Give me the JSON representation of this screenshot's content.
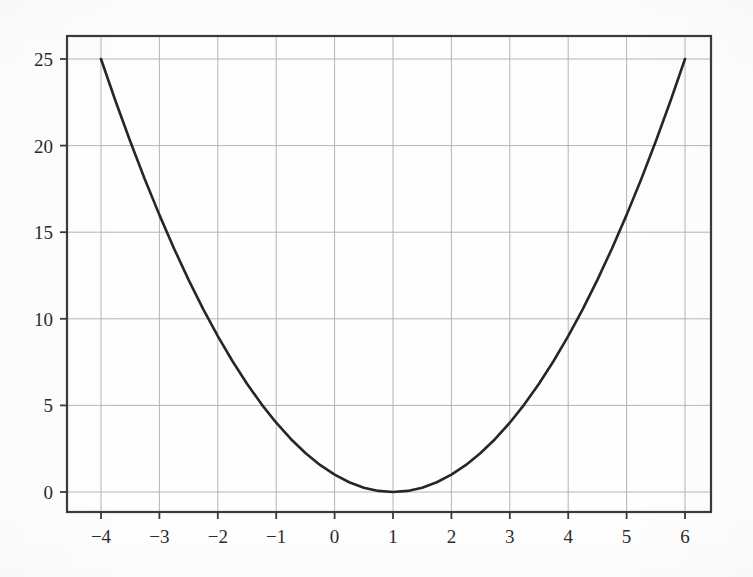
{
  "figure": {
    "background_color": "#fefefe",
    "frame_color": "#3a3a3a",
    "grid_color": "#b4b4b4",
    "curve_color": "#262626",
    "tick_label_color": "#2b2b2b"
  },
  "chart_data": {
    "type": "line",
    "title": "",
    "subtitle": "",
    "xlabel": "",
    "ylabel": "",
    "equation": "y = (x - 1)^2",
    "xlim": [
      -4.6,
      6.45
    ],
    "ylim": [
      -1.4,
      26.3
    ],
    "xticks": [
      -4,
      -3,
      -2,
      -1,
      0,
      1,
      2,
      3,
      4,
      5,
      6
    ],
    "yticks": [
      0,
      5,
      10,
      15,
      20,
      25
    ],
    "xtick_labels": [
      "−4",
      "−3",
      "−2",
      "−1",
      "0",
      "1",
      "2",
      "3",
      "4",
      "5",
      "6"
    ],
    "ytick_labels": [
      "0",
      "5",
      "10",
      "15",
      "20",
      "25"
    ],
    "grid": true,
    "legend": null,
    "legend_position": "none",
    "annotations": [],
    "vertex": {
      "x": 1,
      "y": 0
    },
    "series": [
      {
        "name": "y = (x - 1)^2",
        "color": "#262626",
        "line_width": 2.6,
        "x": [
          -4,
          -3.75,
          -3.5,
          -3.25,
          -3,
          -2.75,
          -2.5,
          -2.25,
          -2,
          -1.75,
          -1.5,
          -1.25,
          -1,
          -0.75,
          -0.5,
          -0.25,
          0,
          0.25,
          0.5,
          0.75,
          1,
          1.25,
          1.5,
          1.75,
          2,
          2.25,
          2.5,
          2.75,
          3,
          3.25,
          3.5,
          3.75,
          4,
          4.25,
          4.5,
          4.75,
          5,
          5.25,
          5.5,
          5.75,
          6
        ],
        "y": [
          25,
          22.5625,
          20.25,
          18.0625,
          16,
          14.0625,
          12.25,
          10.5625,
          9,
          7.5625,
          6.25,
          5.0625,
          4,
          3.0625,
          2.25,
          1.5625,
          1,
          0.5625,
          0.25,
          0.0625,
          0,
          0.0625,
          0.25,
          0.5625,
          1,
          1.5625,
          2.25,
          3.0625,
          4,
          5.0625,
          6.25,
          7.5625,
          9,
          10.5625,
          12.25,
          14.0625,
          16,
          18.0625,
          20.25,
          22.5625,
          25
        ]
      }
    ]
  },
  "geometry": {
    "frame_left_px": 67,
    "frame_right_px": 711,
    "frame_top_px": 36,
    "frame_bottom_px": 512,
    "x_min_px": 101,
    "x_max_px": 685,
    "y_value_25_px": 59,
    "y_value_0_px": 492,
    "tick_length_px": 7
  }
}
